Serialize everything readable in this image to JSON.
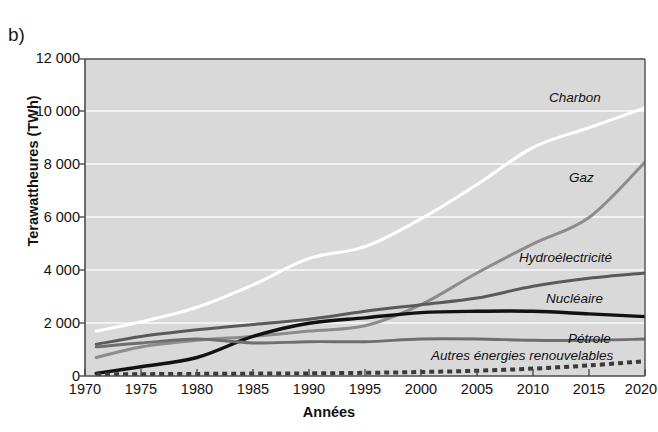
{
  "panel": {
    "label": "b)"
  },
  "axes": {
    "ylabel": "Terawattheures (TWh)",
    "xlabel": "Années",
    "yticks": [
      "0",
      "2 000",
      "4 000",
      "6 000",
      "8 000",
      "10 000",
      "12 000"
    ],
    "xticks": [
      "1970",
      "1975",
      "1980",
      "1985",
      "1990",
      "1995",
      "2000",
      "2005",
      "2010",
      "2015",
      "2020"
    ]
  },
  "labels": {
    "charbon": "Charbon",
    "gaz": "Gaz",
    "hydro": "Hydroélectricité",
    "nucleaire": "Nucléaire",
    "petrole": "Pétrole",
    "autres": "Autres énergies renouvelables"
  },
  "colors": {
    "plot_background": "#d9d9d9",
    "gridline": "#f2f2f2",
    "charbon": "#ffffff",
    "gaz": "#8c8c8c",
    "hydro": "#5a5a5a",
    "nucleaire": "#111111",
    "petrole": "#6e6e6e",
    "autres": "#3a3a3a",
    "axis": "#4d4d4d",
    "text": "#111111"
  },
  "chart_data": {
    "type": "line",
    "title": "",
    "xlabel": "Années",
    "ylabel": "Terawattheures (TWh)",
    "xlim": [
      1970,
      2020
    ],
    "ylim": [
      0,
      12000
    ],
    "grid": true,
    "legend": "inline-right-labels",
    "x": [
      1971,
      1975,
      1980,
      1985,
      1990,
      1995,
      2000,
      2005,
      2010,
      2015,
      2020
    ],
    "series": [
      {
        "name": "Charbon",
        "color": "#ffffff",
        "style": "solid",
        "values": [
          1700,
          2050,
          2600,
          3450,
          4450,
          4900,
          5950,
          7250,
          8650,
          9400,
          10150
        ]
      },
      {
        "name": "Gaz",
        "color": "#8c8c8c",
        "style": "solid",
        "values": [
          700,
          1100,
          1350,
          1500,
          1700,
          1900,
          2700,
          3900,
          5000,
          6000,
          8100
        ]
      },
      {
        "name": "Hydroélectricité",
        "color": "#5a5a5a",
        "style": "solid",
        "values": [
          1200,
          1500,
          1750,
          1950,
          2150,
          2450,
          2700,
          2950,
          3400,
          3700,
          3900
        ]
      },
      {
        "name": "Nucléaire",
        "color": "#111111",
        "style": "solid",
        "values": [
          100,
          350,
          700,
          1500,
          2000,
          2200,
          2400,
          2450,
          2450,
          2350,
          2250
        ]
      },
      {
        "name": "Pétrole",
        "color": "#6e6e6e",
        "style": "solid",
        "values": [
          1100,
          1250,
          1400,
          1250,
          1300,
          1300,
          1400,
          1400,
          1350,
          1350,
          1400
        ]
      },
      {
        "name": "Autres énergies renouvelables",
        "color": "#3a3a3a",
        "style": "dotted",
        "values": [
          60,
          70,
          80,
          90,
          100,
          120,
          150,
          200,
          280,
          400,
          560
        ]
      }
    ]
  }
}
